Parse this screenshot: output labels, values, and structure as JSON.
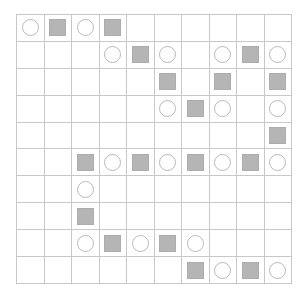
{
  "board": {
    "rows": 10,
    "cols": 10,
    "grid_line_color": "#c8c8c8",
    "background_color": "#ffffff",
    "symbols": {
      "circle": {
        "name": "circle-marker",
        "fill": "#ffffff",
        "stroke": "#b9b9b9"
      },
      "square": {
        "name": "square-marker",
        "fill": "#b5b5b5",
        "stroke": "#adadad"
      },
      "empty": {
        "name": "empty-cell"
      }
    },
    "cells": [
      [
        "circle",
        "square",
        "circle",
        "square",
        "empty",
        "empty",
        "empty",
        "empty",
        "empty",
        "empty"
      ],
      [
        "empty",
        "empty",
        "empty",
        "circle",
        "square",
        "circle",
        "empty",
        "circle",
        "square",
        "circle"
      ],
      [
        "empty",
        "empty",
        "empty",
        "empty",
        "empty",
        "square",
        "empty",
        "square",
        "empty",
        "square"
      ],
      [
        "empty",
        "empty",
        "empty",
        "empty",
        "empty",
        "circle",
        "square",
        "circle",
        "empty",
        "circle"
      ],
      [
        "empty",
        "empty",
        "empty",
        "empty",
        "empty",
        "empty",
        "empty",
        "empty",
        "empty",
        "square"
      ],
      [
        "empty",
        "empty",
        "square",
        "circle",
        "square",
        "circle",
        "square",
        "circle",
        "square",
        "circle"
      ],
      [
        "empty",
        "empty",
        "circle",
        "empty",
        "empty",
        "empty",
        "empty",
        "empty",
        "empty",
        "empty"
      ],
      [
        "empty",
        "empty",
        "square",
        "empty",
        "empty",
        "empty",
        "empty",
        "empty",
        "empty",
        "empty"
      ],
      [
        "empty",
        "empty",
        "circle",
        "square",
        "circle",
        "square",
        "circle",
        "empty",
        "empty",
        "empty"
      ],
      [
        "empty",
        "empty",
        "empty",
        "empty",
        "empty",
        "empty",
        "square",
        "circle",
        "square",
        "circle"
      ]
    ]
  }
}
